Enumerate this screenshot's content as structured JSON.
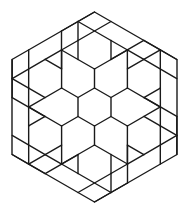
{
  "figure": {
    "stroke_color": "#1a1a1a",
    "background_color": "#ffffff",
    "center": [
      94.5,
      107
    ],
    "unit_length": 19,
    "hexagon_vertices": [
      [
        94.5,
        12
      ],
      [
        177,
        59.5
      ],
      [
        177,
        154.5
      ],
      [
        94.5,
        202
      ],
      [
        12,
        154.5
      ],
      [
        12,
        59.5
      ]
    ],
    "center_hexagon_vertices": [
      [
        94.5,
        88
      ],
      [
        111,
        97.5
      ],
      [
        111,
        116.5
      ],
      [
        94.5,
        126
      ],
      [
        78,
        116.5
      ],
      [
        78,
        97.5
      ]
    ],
    "sector_segments": [
      [
        [
          94.5,
          12
        ],
        [
          78,
          21.5
        ]
      ],
      [
        [
          78,
          21.5
        ],
        [
          61.5,
          31
        ]
      ],
      [
        [
          78,
          21.5
        ],
        [
          111,
          40.5
        ]
      ],
      [
        [
          111,
          21.5
        ],
        [
          78,
          40.5
        ]
      ],
      [
        [
          78,
          40.5
        ],
        [
          61.5,
          50
        ]
      ],
      [
        [
          111,
          40.5
        ],
        [
          127.5,
          50
        ]
      ],
      [
        [
          61.5,
          31
        ],
        [
          61.5,
          69
        ]
      ],
      [
        [
          78,
          21.5
        ],
        [
          78,
          40.5
        ]
      ],
      [
        [
          61.5,
          50
        ],
        [
          94.5,
          69
        ]
      ],
      [
        [
          127.5,
          50
        ],
        [
          94.5,
          69
        ]
      ],
      [
        [
          94.5,
          69
        ],
        [
          94.5,
          88
        ]
      ],
      [
        [
          78,
          40.5
        ],
        [
          78,
          59.5
        ]
      ],
      [
        [
          111,
          40.5
        ],
        [
          111,
          59.5
        ]
      ]
    ],
    "rotational_symmetry": 6
  }
}
